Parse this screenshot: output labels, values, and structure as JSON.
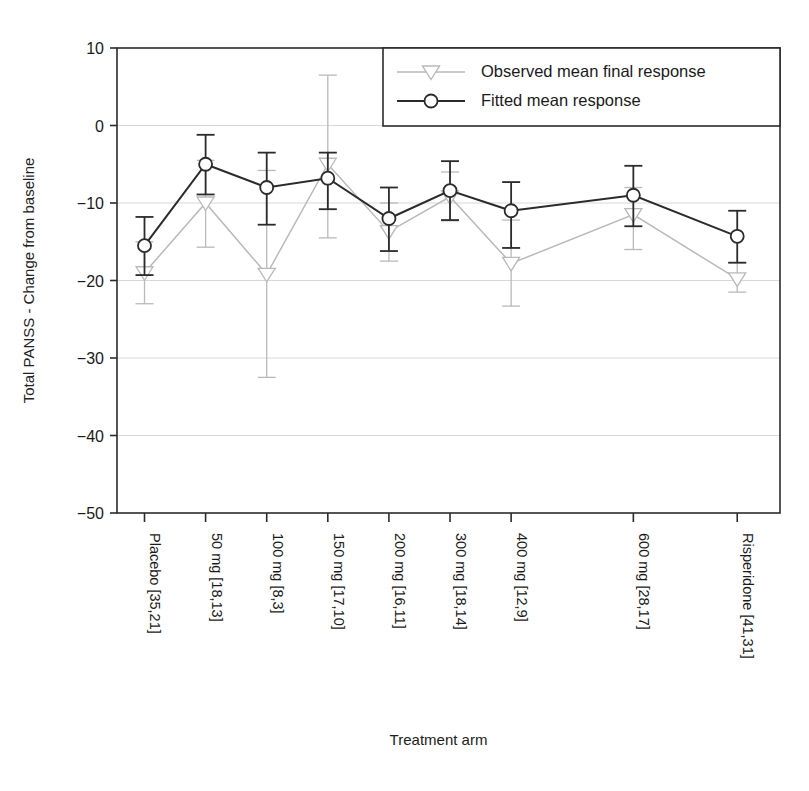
{
  "chart_data": {
    "type": "line",
    "title": "",
    "xlabel": "Treatment arm",
    "ylabel": "Total PANSS - Change from baseline",
    "ylim": [
      -50,
      10
    ],
    "yticks": [
      10,
      0,
      -10,
      -20,
      -30,
      -40,
      -50
    ],
    "ytick_labels": [
      "10",
      "0",
      "−10",
      "−20",
      "−30",
      "−40",
      "−50"
    ],
    "grid": true,
    "grid_axis": "y",
    "legend_position": "top-right",
    "categories": [
      "Placebo [35,21]",
      "50 mg [18,13]",
      "100 mg [8,3]",
      "150 mg [17,10]",
      "200 mg [16,11]",
      "300 mg [18,14]",
      "400 mg [12,9]",
      "600 mg [28,17]",
      "Risperidone [41,31]"
    ],
    "x_positions": [
      0,
      1,
      2,
      3,
      4,
      5,
      6,
      8,
      9.7
    ],
    "series": [
      {
        "name": "Observed mean final response",
        "marker": "triangle-down",
        "color": "#b9b9b9",
        "linestyle": "dashed",
        "values": [
          -19.0,
          -10.0,
          -19.2,
          -5.0,
          -13.7,
          -9.2,
          -17.8,
          -11.5,
          -19.8
        ],
        "err_low": [
          -23.0,
          -15.7,
          -32.5,
          -14.5,
          -17.5,
          -12.3,
          -23.3,
          -16.0,
          -21.5
        ],
        "err_high": [
          -15.0,
          -4.5,
          -5.8,
          6.5,
          -10.0,
          -6.0,
          -12.2,
          -8.0,
          -17.7
        ]
      },
      {
        "name": "Fitted mean response",
        "marker": "circle",
        "color": "#2b2b2b",
        "linestyle": "solid",
        "values": [
          -15.5,
          -5.0,
          -8.0,
          -6.8,
          -12.0,
          -8.4,
          -11.0,
          -9.0,
          -14.3
        ],
        "err_low": [
          -19.3,
          -8.9,
          -12.8,
          -10.8,
          -16.2,
          -12.2,
          -15.8,
          -13.0,
          -17.7
        ],
        "err_high": [
          -11.8,
          -1.2,
          -3.5,
          -3.5,
          -8.0,
          -4.6,
          -7.3,
          -5.2,
          -11.0
        ]
      }
    ]
  },
  "legend": {
    "entries": [
      {
        "label": "Observed mean final response"
      },
      {
        "label": "Fitted mean response"
      }
    ]
  }
}
